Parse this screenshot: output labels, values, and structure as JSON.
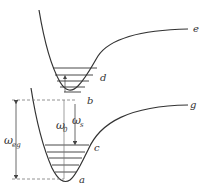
{
  "diagram": {
    "type": "potential-energy-curves",
    "colors": {
      "line": "#333333",
      "dashed": "#777777",
      "arrow": "#444444"
    },
    "curves": [
      {
        "id": "upper",
        "label": "e"
      },
      {
        "id": "lower",
        "label": "g"
      }
    ],
    "points": {
      "a": "a",
      "b": "b",
      "c": "c",
      "d": "d"
    },
    "transitions": {
      "omega_eg": {
        "symbol": "ω",
        "sub": "eg"
      },
      "omega_0": {
        "symbol": "ω",
        "sub": "0"
      },
      "omega_s": {
        "symbol": "ω",
        "sub": "s"
      }
    }
  }
}
